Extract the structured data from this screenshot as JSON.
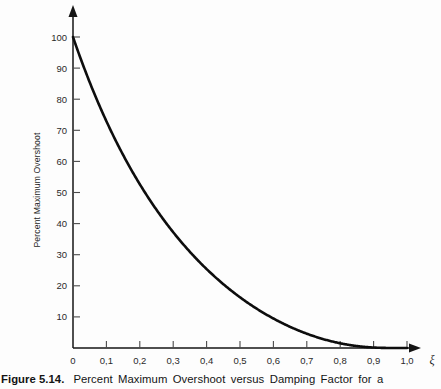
{
  "figure": {
    "caption_label": "Figure 5.14.",
    "caption_text": "Percent Maximum Overshoot versus Damping Factor for a",
    "background_color": "#fdfdfd",
    "curve_color": "#0d0d0d",
    "axis_color": "#151515"
  },
  "chart_data": {
    "type": "line",
    "title": "Percent Maximum Overshoot versus Damping Factor for a",
    "xlabel": "ξ",
    "ylabel": "Percent Maximum Overshoot",
    "xlim": [
      0,
      1.1
    ],
    "ylim": [
      0,
      105
    ],
    "grid": false,
    "legend": null,
    "x_tick_labels": [
      "0",
      "0,1",
      "0,2",
      "0,3",
      "0,4",
      "0,5",
      "0,6",
      "0,7",
      "0,8",
      "0,9",
      "1,0"
    ],
    "x_tick_values": [
      0,
      0.1,
      0.2,
      0.3,
      0.4,
      0.5,
      0.6,
      0.7,
      0.8,
      0.9,
      1.0
    ],
    "y_tick_labels": [
      "0",
      "10",
      "20",
      "30",
      "40",
      "50",
      "60",
      "70",
      "80",
      "90",
      "100"
    ],
    "y_tick_values": [
      0,
      10,
      20,
      30,
      40,
      50,
      60,
      70,
      80,
      90,
      100
    ],
    "series": [
      {
        "name": "Percent Maximum Overshoot",
        "formula": "100*exp(-pi*xi/sqrt(1-xi^2))",
        "x": [
          0.0,
          0.05,
          0.1,
          0.15,
          0.2,
          0.25,
          0.3,
          0.35,
          0.4,
          0.45,
          0.5,
          0.55,
          0.6,
          0.65,
          0.7,
          0.75,
          0.8,
          0.85,
          0.9,
          0.95,
          1.0
        ],
        "values": [
          100.0,
          85.4,
          72.9,
          62.0,
          52.7,
          44.4,
          37.2,
          30.9,
          25.4,
          20.5,
          16.3,
          12.6,
          9.5,
          6.8,
          4.6,
          2.8,
          1.5,
          0.63,
          0.15,
          0.01,
          0.0
        ]
      }
    ]
  }
}
